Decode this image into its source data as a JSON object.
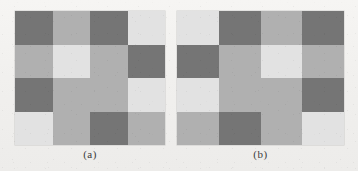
{
  "figure": {
    "type": "grid-pair-figure",
    "background_color": "#f2f1ef",
    "palette": {
      "dark": "#757575",
      "medium": "#b0b0b0",
      "light": "#e2e2e2"
    },
    "panels": [
      {
        "id": "a",
        "caption": "(a)",
        "rows": 4,
        "cols": 4,
        "cells": [
          [
            "dark",
            "medium",
            "dark",
            "light"
          ],
          [
            "medium",
            "light",
            "medium",
            "dark"
          ],
          [
            "dark",
            "medium",
            "medium",
            "light"
          ],
          [
            "light",
            "medium",
            "dark",
            "medium"
          ]
        ]
      },
      {
        "id": "b",
        "caption": "(b)",
        "rows": 4,
        "cols": 4,
        "cells": [
          [
            "light",
            "dark",
            "medium",
            "dark"
          ],
          [
            "dark",
            "medium",
            "light",
            "medium"
          ],
          [
            "light",
            "medium",
            "medium",
            "dark"
          ],
          [
            "medium",
            "dark",
            "medium",
            "light"
          ]
        ]
      }
    ]
  }
}
